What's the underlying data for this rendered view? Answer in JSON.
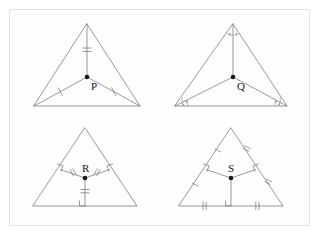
{
  "page": {
    "background": "#ffffff",
    "card_background": "#fefefe",
    "card_border": "#e3e3e3",
    "line_color": "#6e6e74",
    "mark_color": "#8a8a90",
    "point_color": "#17171a",
    "title": ""
  },
  "figures": [
    {
      "id": "figure-p",
      "label": "P",
      "position": "top-left",
      "description": "Triangle with a point P joined to the apex by a vertical segment marked with a double tick, and joined to the two base vertices by segments each marked with a single tick.",
      "point_label": "P",
      "marks": {
        "apex_segment_ticks": 2,
        "left_segment_ticks": 1,
        "right_segment_ticks": 1,
        "angle_arcs": 0,
        "right_angles": 0
      }
    },
    {
      "id": "figure-q",
      "label": "Q",
      "position": "top-right",
      "description": "Triangle with a point Q joined to all three vertices; each vertex angle is split into two equal parts shown by paired arcs (angle bisectors meeting at Q).",
      "point_label": "Q",
      "marks": {
        "apex_angle_arcs": 2,
        "bottom_left_angle_arcs": 2,
        "bottom_right_angle_arcs": 2,
        "segment_ticks": 0,
        "right_angles": 0
      }
    },
    {
      "id": "figure-r",
      "label": "R",
      "position": "bottom-left",
      "description": "Triangle with a point R joined by perpendicular segments to all three sides; each perpendicular foot carries a right-angle square and each segment carries a double tick.",
      "point_label": "R",
      "marks": {
        "left_perp_ticks": 2,
        "right_perp_ticks": 2,
        "base_perp_ticks": 2,
        "right_angles": 3,
        "angle_arcs": 0
      }
    },
    {
      "id": "figure-s",
      "label": "S",
      "position": "bottom-right",
      "description": "Triangle with a point S joined by perpendicular segments to all three sides; right-angle squares at each foot and tick marks dividing each side into two equal parts.",
      "point_label": "S",
      "marks": {
        "left_side_upper_ticks": 1,
        "left_side_lower_ticks": 1,
        "right_side_upper_ticks": 2,
        "right_side_lower_ticks": 2,
        "base_left_ticks": 2,
        "base_right_ticks": 2,
        "right_angles": 3
      }
    }
  ]
}
